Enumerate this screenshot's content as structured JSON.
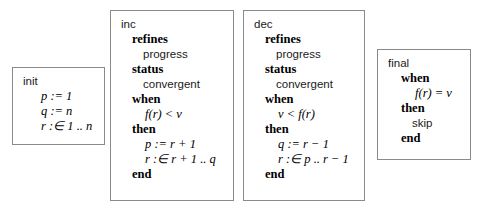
{
  "diagram": {
    "border_color": "#8a8a8a",
    "text_color": "#1a1a1a",
    "background": "#ffffff"
  },
  "events": {
    "init": {
      "name": "init",
      "lines": [
        {
          "kind": "math",
          "text": "p := 1"
        },
        {
          "kind": "math",
          "text": "q := n"
        },
        {
          "kind": "math",
          "text": "r :∈ 1 .. n"
        }
      ]
    },
    "inc": {
      "name": "inc",
      "refines_kw": "refines",
      "refines_val": "progress",
      "status_kw": "status",
      "status_val": "convergent",
      "when_kw": "when",
      "guard": "f(r) < v",
      "then_kw": "then",
      "action1": "p := r + 1",
      "action2": "r :∈ r + 1 .. q",
      "end_kw": "end"
    },
    "dec": {
      "name": "dec",
      "refines_kw": "refines",
      "refines_val": "progress",
      "status_kw": "status",
      "status_val": "convergent",
      "when_kw": "when",
      "guard": "v < f(r)",
      "then_kw": "then",
      "action1": "q := r − 1",
      "action2": "r :∈ p .. r − 1",
      "end_kw": "end"
    },
    "final": {
      "name": "final",
      "when_kw": "when",
      "guard": "f(r) = v",
      "then_kw": "then",
      "action": "skip",
      "end_kw": "end"
    }
  }
}
